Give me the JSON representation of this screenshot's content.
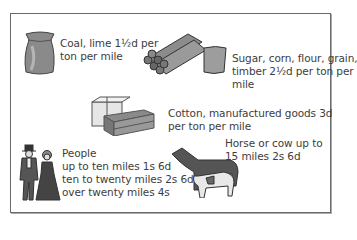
{
  "rates": [
    {
      "id": "coal",
      "icon": "sack-icon",
      "lines": [
        "Coal, lime 1½d per",
        "ton per mile"
      ]
    },
    {
      "id": "sugar",
      "icon": "logs-and-sack-icon",
      "lines": [
        "Sugar, corn, flour, grain,",
        "timber 2½d per ton per",
        "mile"
      ]
    },
    {
      "id": "cotton",
      "icon": "bales-and-crate-icon",
      "lines": [
        "Cotton, manufactured goods 3d",
        "per ton per mile"
      ]
    },
    {
      "id": "horse",
      "icon": "horse-and-cow-icon",
      "lines": [
        "Horse or cow up to",
        "15 miles 2s 6d"
      ]
    },
    {
      "id": "people",
      "icon": "victorian-couple-icon",
      "lines": [
        "People",
        "up to ten miles 1s 6d",
        "ten to twenty miles 2s 6d",
        "over twenty miles 4s"
      ]
    }
  ],
  "colors": {
    "border": "#6a6a6a",
    "text": "#3d3d3d"
  }
}
